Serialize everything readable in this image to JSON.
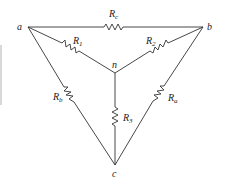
{
  "diagram": {
    "type": "circuit",
    "nodes": [
      {
        "id": "a",
        "label": "a"
      },
      {
        "id": "b",
        "label": "b"
      },
      {
        "id": "c",
        "label": "c"
      },
      {
        "id": "n",
        "label": "n"
      }
    ],
    "resistors": [
      {
        "id": "Rc",
        "label": "R",
        "sub": "c",
        "from": "a",
        "to": "b"
      },
      {
        "id": "R1",
        "label": "R",
        "sub": "1",
        "from": "a",
        "to": "n"
      },
      {
        "id": "R2",
        "label": "R",
        "sub": "2",
        "from": "b",
        "to": "n"
      },
      {
        "id": "R3",
        "label": "R",
        "sub": "3",
        "from": "n",
        "to": "c"
      },
      {
        "id": "Rb",
        "label": "R",
        "sub": "b",
        "from": "a",
        "to": "c"
      },
      {
        "id": "Ra",
        "label": "R",
        "sub": "a",
        "from": "b",
        "to": "c"
      }
    ],
    "colors": {
      "line": "#333333",
      "background": "#ffffff"
    }
  }
}
